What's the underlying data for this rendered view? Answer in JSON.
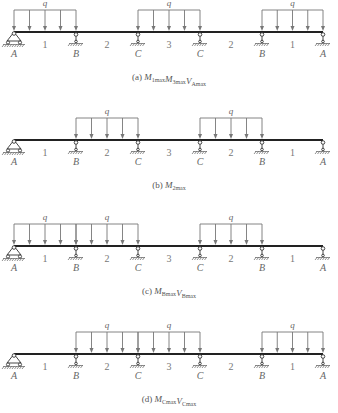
{
  "support_x": [
    14,
    76,
    138,
    200,
    262,
    323
  ],
  "support_labels": [
    "A",
    "B",
    "C",
    "C",
    "B",
    "A"
  ],
  "span_labels": [
    "1",
    "2",
    "3",
    "2",
    "1"
  ],
  "load_symbol": "q",
  "diagrams": [
    {
      "id": "a",
      "beam_y": 32,
      "loaded_spans": [
        0,
        2,
        4
      ],
      "caption": {
        "prefix": "(a) ",
        "terms": [
          {
            "M": "M",
            "sub": "1max"
          },
          {
            "M": "M",
            "sub": "3max"
          },
          {
            "M": "V",
            "sub": "Amax"
          }
        ]
      }
    },
    {
      "id": "b",
      "beam_y": 140,
      "loaded_spans": [
        1,
        3
      ],
      "caption": {
        "prefix": "(b) ",
        "terms": [
          {
            "M": "M",
            "sub": "2max"
          }
        ]
      }
    },
    {
      "id": "c",
      "beam_y": 246,
      "loaded_spans": [
        0,
        1,
        3
      ],
      "caption": {
        "prefix": "(c) ",
        "terms": [
          {
            "M": "M",
            "sub": "Bmax"
          },
          {
            "M": "V",
            "sub": "Bmax"
          }
        ]
      }
    },
    {
      "id": "d",
      "beam_y": 354,
      "loaded_spans": [
        1,
        2,
        4
      ],
      "caption": {
        "prefix": "(d) ",
        "terms": [
          {
            "M": "M",
            "sub": "Cmax"
          },
          {
            "M": "V",
            "sub": "Cmax"
          }
        ]
      }
    }
  ],
  "captions_text": [
    "(a) M1max M3max VAmax",
    "(b) M2max",
    "(c) MBmax VBmax",
    "(d) MCmax VCmax"
  ]
}
